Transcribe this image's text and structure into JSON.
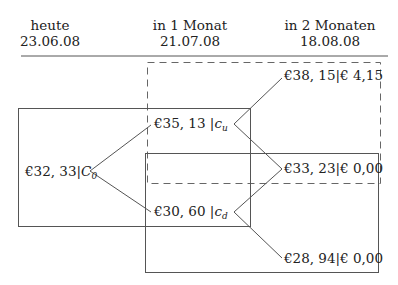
{
  "columns": [
    {
      "label": "heute",
      "date": "23.06.08"
    },
    {
      "label": "in 1 Monat",
      "date": "21.07.08"
    },
    {
      "label": "in 2 Monaten",
      "date": "18.08.08"
    }
  ],
  "nodes": {
    "root": {
      "price": "€32, 33",
      "sep": "|",
      "var": "C",
      "sub": "0"
    },
    "up": {
      "price": "€35, 13",
      "sep": " |",
      "var": "c",
      "sub": "u"
    },
    "down": {
      "price": "€30, 60",
      "sep": " |",
      "var": "c",
      "sub": "d"
    },
    "uu": {
      "price": "€38, 15",
      "sep": "|",
      "payoff": "€ 4,15"
    },
    "ud": {
      "price": "€33, 23",
      "sep": "|",
      "payoff": "€ 0,00"
    },
    "dd": {
      "price": "€28, 94",
      "sep": "|",
      "payoff": "€ 0,00"
    }
  },
  "colors": {
    "line": "#555555",
    "text": "#222222"
  }
}
